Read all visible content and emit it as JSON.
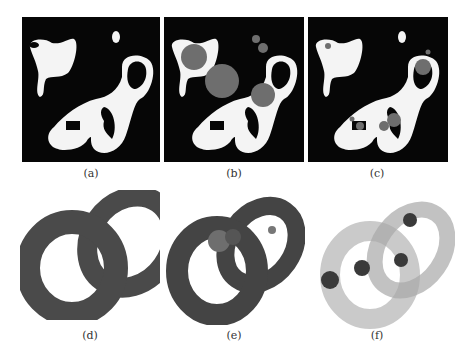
{
  "figure": {
    "panels": [
      {
        "id": "a",
        "label": "(a)",
        "content": "2D binary shape: white blobs on black background"
      },
      {
        "id": "b",
        "label": "(b)",
        "content": "2D shape with large gray disks (medial balls)"
      },
      {
        "id": "c",
        "label": "(c)",
        "content": "2D shape with small gray disks near holes"
      },
      {
        "id": "d",
        "label": "(d)",
        "content": "3D linked tori, dark gray solid"
      },
      {
        "id": "e",
        "label": "(e)",
        "content": "3D linked tori with inner gray spheres"
      },
      {
        "id": "f",
        "label": "(f)",
        "content": "3D translucent linked tori with dark spheres"
      }
    ]
  },
  "colors": {
    "background": "#ffffff",
    "panel_black": "#060606",
    "shape_white": "#f4f4f4",
    "disk_gray": "#6e6e6e",
    "torus_dark": "#4a4a4a",
    "torus_translucent": "#b8b8b8",
    "sphere_dark": "#3a3a3a"
  }
}
